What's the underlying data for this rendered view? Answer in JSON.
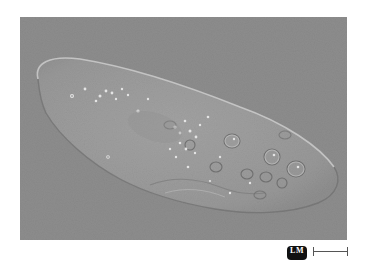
{
  "figure": {
    "background_color": "#8d8d8d",
    "cell_color": "#9b9b9b",
    "cell_edge_color": "#c8c8c8"
  },
  "badge": {
    "label": "LM"
  },
  "scale_bar": {
    "label": ""
  }
}
